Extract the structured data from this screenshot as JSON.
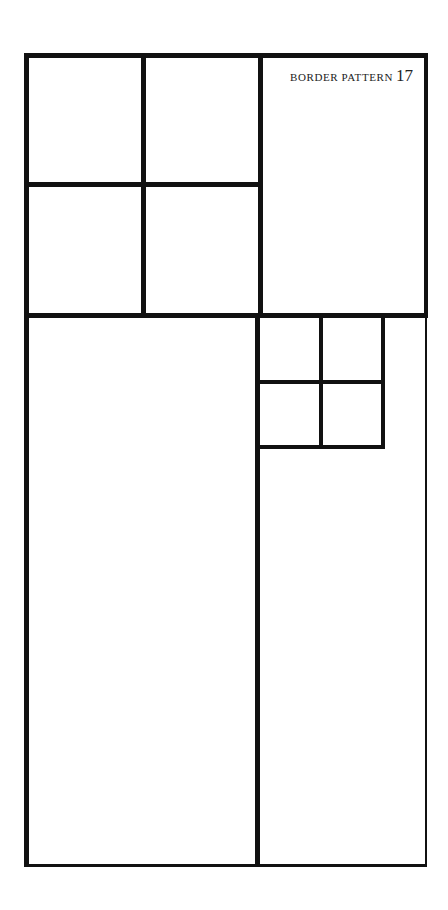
{
  "title": {
    "text": "BORDER PATTERN",
    "number": "17"
  },
  "colors": {
    "line": "#111111",
    "background": "#ffffff"
  },
  "diagram": {
    "outer_frame": {
      "left": 24,
      "top": 53,
      "right": 427,
      "bottom": 867
    },
    "regions": [
      {
        "name": "top-left-2x2-grid",
        "cells": 4
      },
      {
        "name": "top-right-label-panel",
        "cells": 1
      },
      {
        "name": "bottom-left-tall-panel",
        "cells": 1
      },
      {
        "name": "bottom-right-small-2x2-grid",
        "cells": 4
      },
      {
        "name": "bottom-right-tall-panel",
        "cells": 1
      }
    ]
  }
}
